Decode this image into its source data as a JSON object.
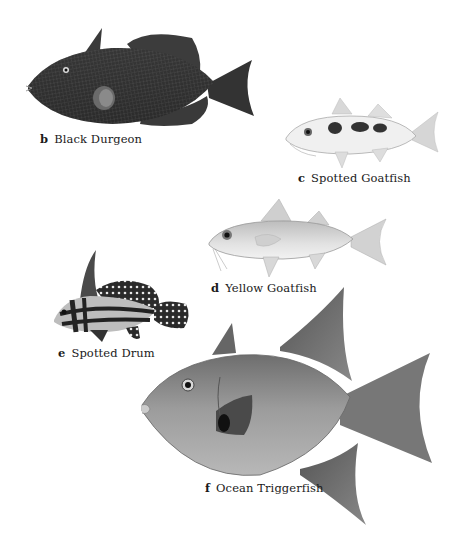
{
  "plate": {
    "figures": [
      {
        "letter": "b",
        "name": "Black Durgeon",
        "tone": "#2e2e2e"
      },
      {
        "letter": "c",
        "name": "Spotted Goatfish",
        "tone": "#e6e6e6"
      },
      {
        "letter": "d",
        "name": "Yellow Goatfish",
        "tone": "#d4d4d4"
      },
      {
        "letter": "e",
        "name": "Spotted Drum",
        "tone": "#3a3a3a"
      },
      {
        "letter": "f",
        "name": "Ocean Triggerfish",
        "tone": "#9a9a9a"
      }
    ]
  }
}
